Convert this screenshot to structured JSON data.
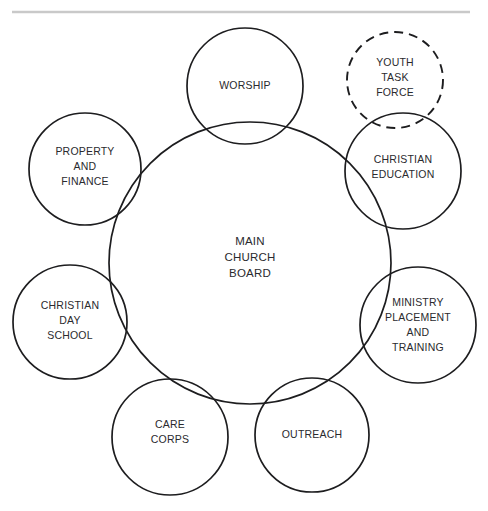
{
  "diagram": {
    "title_rule": {
      "color": "#c9c9c9",
      "x1": 12,
      "x2": 470,
      "y": 12,
      "thickness": 2.5
    },
    "stroke_color": "#1d1d1f",
    "text_color": "#2a2a2e",
    "background": "#ffffff",
    "center_node": {
      "id": "main-church-board",
      "lines": [
        "MAIN",
        "CHURCH",
        "BOARD"
      ],
      "cx": 250,
      "cy": 263,
      "r": 141,
      "stroke_style": "solid",
      "stroke_width": 1.7,
      "text_cx": 250,
      "text_cy": 258,
      "line_height": 16
    },
    "nodes": [
      {
        "id": "worship",
        "lines": [
          "WORSHIP"
        ],
        "cx": 245,
        "cy": 86,
        "r": 58,
        "stroke_style": "solid",
        "stroke_width": 1.7,
        "text_cx": 245,
        "text_cy": 86,
        "line_height": 15
      },
      {
        "id": "youth-task-force",
        "lines": [
          "YOUTH",
          "TASK",
          "FORCE"
        ],
        "cx": 395,
        "cy": 80,
        "r": 48,
        "stroke_style": "dashed",
        "stroke_width": 1.9,
        "dash_pattern": "9 6",
        "text_cx": 395,
        "text_cy": 78,
        "line_height": 15
      },
      {
        "id": "christian-education",
        "lines": [
          "CHRISTIAN",
          "EDUCATION"
        ],
        "cx": 403,
        "cy": 171,
        "r": 58,
        "stroke_style": "solid",
        "stroke_width": 1.7,
        "text_cx": 403,
        "text_cy": 167,
        "line_height": 15
      },
      {
        "id": "ministry-placement-and-training",
        "lines": [
          "MINISTRY",
          "PLACEMENT",
          "AND",
          "TRAINING"
        ],
        "cx": 418,
        "cy": 325,
        "r": 58,
        "stroke_style": "solid",
        "stroke_width": 1.7,
        "text_cx": 418,
        "text_cy": 325,
        "line_height": 15
      },
      {
        "id": "outreach",
        "lines": [
          "OUTREACH"
        ],
        "cx": 312,
        "cy": 435,
        "r": 57,
        "stroke_style": "solid",
        "stroke_width": 1.7,
        "text_cx": 312,
        "text_cy": 435,
        "line_height": 15
      },
      {
        "id": "care-corps",
        "lines": [
          "CARE",
          "CORPS"
        ],
        "cx": 170,
        "cy": 437,
        "r": 58,
        "stroke_style": "solid",
        "stroke_width": 1.7,
        "text_cx": 170,
        "text_cy": 432,
        "line_height": 15
      },
      {
        "id": "christian-day-school",
        "lines": [
          "CHRISTIAN",
          "DAY",
          "SCHOOL"
        ],
        "cx": 70,
        "cy": 322,
        "r": 57,
        "stroke_style": "solid",
        "stroke_width": 1.7,
        "text_cx": 70,
        "text_cy": 321,
        "line_height": 15
      },
      {
        "id": "property-and-finance",
        "lines": [
          "PROPERTY",
          "AND",
          "FINANCE"
        ],
        "cx": 85,
        "cy": 169,
        "r": 56,
        "stroke_style": "solid",
        "stroke_width": 1.7,
        "text_cx": 85,
        "text_cy": 167,
        "line_height": 15
      }
    ]
  }
}
